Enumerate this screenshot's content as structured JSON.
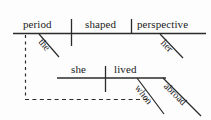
{
  "diagram": {
    "type": "sentence-diagram",
    "style": "Reed-Kellogg",
    "sentence": "The period shaped her perspective when she lived abroad",
    "colors": {
      "ink": "#1b1b1b",
      "line": "#2b2b2b",
      "background": "#fdfdfd"
    },
    "main_clause": {
      "subject": "period",
      "verb": "shaped",
      "object": "perspective",
      "subject_modifier": "the",
      "object_modifier": "her"
    },
    "subordinate_clause": {
      "subject": "she",
      "verb": "lived",
      "modifier": "abroad",
      "connector": "when"
    },
    "words": {
      "period": "period",
      "shaped": "shaped",
      "perspective": "perspective",
      "the": "the",
      "her": "her",
      "she": "she",
      "lived": "lived",
      "abroad": "abroad",
      "when": "when"
    }
  }
}
